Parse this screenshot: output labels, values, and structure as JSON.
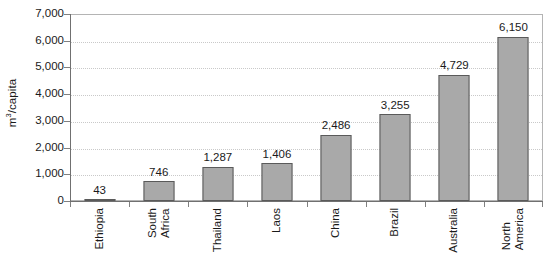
{
  "chart_data": {
    "type": "bar",
    "title": "",
    "xlabel": "",
    "ylabel": "m3/capita",
    "ylabel_parts": {
      "prefix": "m",
      "sup": "3",
      "suffix": "/capita"
    },
    "categories": [
      "Ethiopia",
      "South Africa",
      "Thailand",
      "Laos",
      "China",
      "Brazil",
      "Australia",
      "North America"
    ],
    "category_lines": [
      [
        "Ethiopia"
      ],
      [
        "South",
        "Africa"
      ],
      [
        "Thailand"
      ],
      [
        "Laos"
      ],
      [
        "China"
      ],
      [
        "Brazil"
      ],
      [
        "Australia"
      ],
      [
        "North",
        "America"
      ]
    ],
    "values": [
      43,
      746,
      1287,
      1406,
      2486,
      3255,
      4729,
      6150
    ],
    "value_labels": [
      "43",
      "746",
      "1,287",
      "1,406",
      "2,486",
      "3,255",
      "4,729",
      "6,150"
    ],
    "ylim": [
      0,
      7000
    ],
    "ytick_values": [
      0,
      1000,
      2000,
      3000,
      4000,
      5000,
      6000,
      7000
    ],
    "ytick_labels": [
      "0",
      "1,000",
      "2,000",
      "3,000",
      "4,000",
      "5,000",
      "6,000",
      "7,000"
    ],
    "grid": true,
    "grid_style": "dotted",
    "legend": false,
    "legend_position": "none",
    "bar_color": "#a9a9a9",
    "bar_edge_color": "#5a5a5a",
    "grid_color": "#c9c9c9",
    "axis_color": "#707070",
    "frame_color": "#b4b4b4",
    "text_color": "#1a1a1a",
    "background_color": "#ffffff"
  }
}
